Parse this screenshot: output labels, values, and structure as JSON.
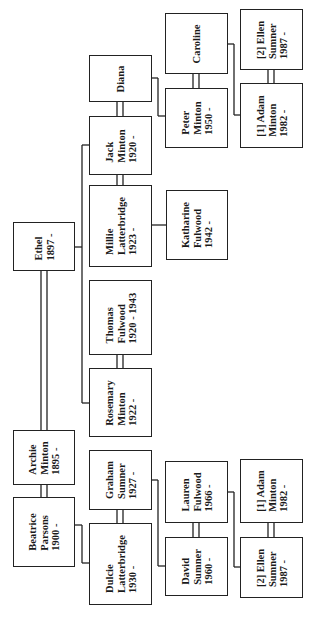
{
  "diagram": {
    "type": "family-tree",
    "orientation": "rotated-90-ccw",
    "people": [
      {
        "id": "diana",
        "lines": [
          "Diana"
        ]
      },
      {
        "id": "jack",
        "lines": [
          "Jack",
          "Minton",
          "1920 -"
        ]
      },
      {
        "id": "millie",
        "lines": [
          "Millie",
          "Latterbridge",
          "1923 -"
        ]
      },
      {
        "id": "thomas",
        "lines": [
          "Thomas",
          "Fulwood",
          "1920 - 1943"
        ]
      },
      {
        "id": "rosemary",
        "lines": [
          "Rosemary",
          "Minton",
          "1922 -"
        ]
      },
      {
        "id": "ethel",
        "lines": [
          "Ethel",
          "1897 -"
        ]
      },
      {
        "id": "archie",
        "lines": [
          "Archie",
          "Minton",
          "1895 -"
        ]
      },
      {
        "id": "beatrice",
        "lines": [
          "Beatrice",
          "Parsons",
          "1900 -"
        ]
      },
      {
        "id": "graham",
        "lines": [
          "Graham",
          "Sumner",
          "1927 -"
        ]
      },
      {
        "id": "dulcie",
        "lines": [
          "Dulcie",
          "Latterbridge",
          "1930 -"
        ]
      },
      {
        "id": "katharine",
        "lines": [
          "Katharine",
          "Fulwood",
          "1942 -"
        ]
      },
      {
        "id": "caroline",
        "lines": [
          "Caroline"
        ]
      },
      {
        "id": "peter",
        "lines": [
          "Peter",
          "Minton",
          "1950 -"
        ]
      },
      {
        "id": "ellen_top",
        "lines": [
          "[2] Ellen",
          "Sumner",
          "1987 -"
        ]
      },
      {
        "id": "adam_top",
        "lines": [
          "[1] Adam",
          "Minton",
          "1982 -"
        ]
      },
      {
        "id": "lauren",
        "lines": [
          "Lauren",
          "Fulwood",
          "1966 -"
        ]
      },
      {
        "id": "david",
        "lines": [
          "David",
          "Sumner",
          "1960 -"
        ]
      },
      {
        "id": "adam_bottom",
        "lines": [
          "[1] Adam",
          "Minton",
          "1982 -"
        ]
      },
      {
        "id": "ellen_bottom",
        "lines": [
          "[2] Ellen",
          "Sumner",
          "1987 -"
        ]
      }
    ],
    "marriages": [
      [
        "diana",
        "jack"
      ],
      [
        "millie",
        "jack"
      ],
      [
        "thomas",
        "rosemary"
      ],
      [
        "ethel",
        "archie"
      ],
      [
        "archie",
        "beatrice"
      ],
      [
        "graham",
        "dulcie"
      ],
      [
        "caroline",
        "peter"
      ],
      [
        "ellen_top",
        "adam_top"
      ],
      [
        "lauren",
        "david"
      ],
      [
        "adam_bottom",
        "ellen_bottom"
      ]
    ],
    "descents": [
      {
        "parents": "ethel",
        "children": [
          "jack",
          "millie",
          "thomas",
          "rosemary"
        ]
      },
      {
        "parents": "thomas+millie",
        "children": [
          "katharine"
        ]
      },
      {
        "parents": "diana+jack",
        "children": [
          "peter"
        ]
      },
      {
        "parents": "caroline+peter",
        "children": [
          "adam_top"
        ]
      },
      {
        "parents": "beatrice",
        "children": [
          "dulcie"
        ]
      },
      {
        "parents": "graham+dulcie",
        "children": [
          "david"
        ]
      },
      {
        "parents": "lauren+david",
        "children": [
          "ellen_bottom"
        ]
      }
    ],
    "page_number": ""
  }
}
